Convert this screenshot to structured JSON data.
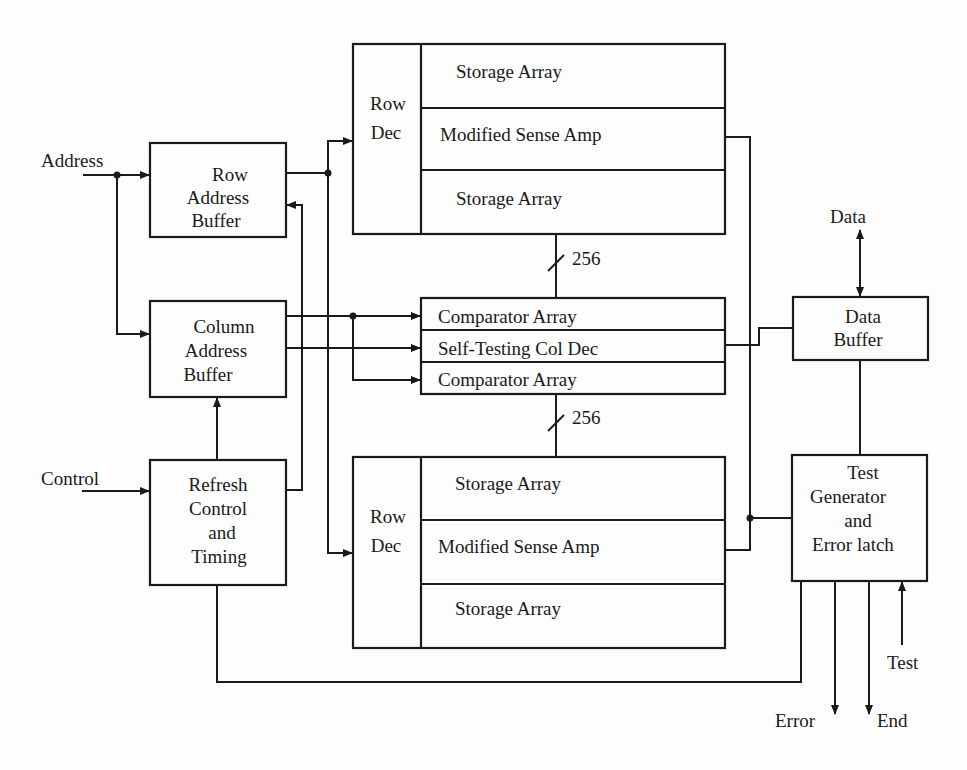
{
  "diagram": {
    "type": "block-diagram",
    "inputs": {
      "address": "Address",
      "control": "Control",
      "data": "Data",
      "test": "Test"
    },
    "outputs": {
      "error": "Error",
      "end": "End"
    },
    "blocks": {
      "row_address_buffer": [
        "Row",
        "Address",
        "Buffer"
      ],
      "column_address_buffer": [
        "Column",
        "Address",
        "Buffer"
      ],
      "refresh_control": [
        "Refresh",
        "Control",
        "and",
        "Timing"
      ],
      "data_buffer": [
        "Data",
        "Buffer"
      ],
      "test_generator": [
        "Test",
        "Generator",
        "and",
        "Error latch"
      ],
      "top_memory": {
        "row_dec": [
          "Row",
          "Dec"
        ],
        "rows": [
          "Storage Array",
          "Modified Sense Amp",
          "Storage Array"
        ]
      },
      "middle_block": {
        "rows": [
          "Comparator Array",
          "Self-Testing Col Dec",
          "Comparator Array"
        ]
      },
      "bottom_memory": {
        "row_dec": [
          "Row",
          "Dec"
        ],
        "rows": [
          "Storage Array",
          "Modified Sense Amp",
          "Storage Array"
        ]
      }
    },
    "bus_labels": {
      "upper": "256",
      "lower": "256"
    }
  }
}
